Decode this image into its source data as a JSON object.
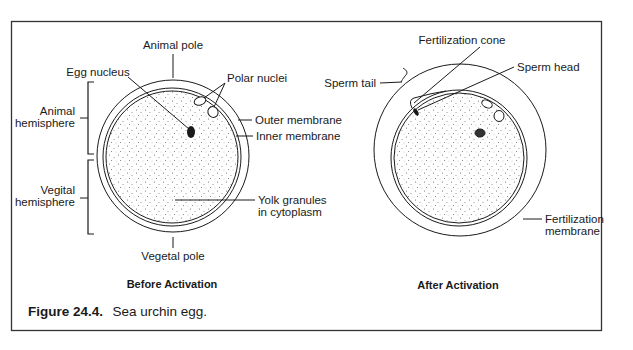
{
  "figure": {
    "caption_number": "Figure 24.4.",
    "caption_text": "Sea urchin egg.",
    "colors": {
      "line": "#1a1a1a",
      "background": "#ffffff",
      "stipple": "#555555"
    }
  },
  "before": {
    "title": "Before Activation",
    "labels": {
      "animal_pole": "Animal pole",
      "egg_nucleus": "Egg nucleus",
      "polar_nuclei": "Polar nuclei",
      "animal_hemisphere_1": "Animal",
      "animal_hemisphere_2": "hemisphere",
      "outer_membrane": "Outer membrane",
      "inner_membrane": "Inner membrane",
      "vegital_hemisphere_1": "Vegital",
      "vegital_hemisphere_2": "hemisphere",
      "yolk_1": "Yolk granules",
      "yolk_2": "in cytoplasm",
      "vegetal_pole": "Vegetal pole"
    }
  },
  "after": {
    "title": "After Activation",
    "labels": {
      "fertilization_cone": "Fertilization cone",
      "sperm_head": "Sperm head",
      "sperm_tail": "Sperm tail",
      "fertilization_membrane_1": "Fertilization",
      "fertilization_membrane_2": "membrane"
    }
  }
}
